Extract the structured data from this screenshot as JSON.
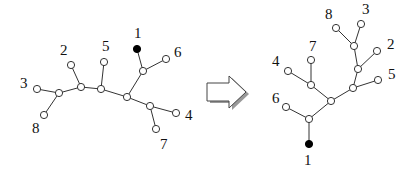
{
  "diagram": {
    "colors": {
      "edge": "#333333",
      "open_node": "#ffffff",
      "root_node": "#000000"
    },
    "left_tree": {
      "nodes": [
        {
          "id": "l1",
          "x": 137,
          "y": 49,
          "filled": true
        },
        {
          "id": "l2",
          "x": 71,
          "y": 65
        },
        {
          "id": "l3",
          "x": 37,
          "y": 89
        },
        {
          "id": "l4",
          "x": 176,
          "y": 113
        },
        {
          "id": "l5",
          "x": 104,
          "y": 62
        },
        {
          "id": "l6",
          "x": 166,
          "y": 59
        },
        {
          "id": "l7",
          "x": 156,
          "y": 129
        },
        {
          "id": "l8",
          "x": 44,
          "y": 115
        },
        {
          "id": "jA",
          "x": 59,
          "y": 93
        },
        {
          "id": "jB",
          "x": 81,
          "y": 87
        },
        {
          "id": "jC",
          "x": 101,
          "y": 89
        },
        {
          "id": "jD",
          "x": 127,
          "y": 97
        },
        {
          "id": "jE",
          "x": 143,
          "y": 71
        },
        {
          "id": "jF",
          "x": 150,
          "y": 106
        }
      ],
      "edges": [
        [
          "l3",
          "jA"
        ],
        [
          "l8",
          "jA"
        ],
        [
          "jA",
          "jB"
        ],
        [
          "l2",
          "jB"
        ],
        [
          "jB",
          "jC"
        ],
        [
          "l5",
          "jC"
        ],
        [
          "jC",
          "jD"
        ],
        [
          "jD",
          "jE"
        ],
        [
          "l1",
          "jE"
        ],
        [
          "l6",
          "jE"
        ],
        [
          "jD",
          "jF"
        ],
        [
          "l4",
          "jF"
        ],
        [
          "l7",
          "jF"
        ]
      ],
      "labels": [
        {
          "text": "1",
          "x": 134,
          "y": 38
        },
        {
          "text": "2",
          "x": 60,
          "y": 55
        },
        {
          "text": "3",
          "x": 20,
          "y": 88
        },
        {
          "text": "4",
          "x": 185,
          "y": 120
        },
        {
          "text": "5",
          "x": 102,
          "y": 51
        },
        {
          "text": "6",
          "x": 174,
          "y": 57
        },
        {
          "text": "7",
          "x": 160,
          "y": 149
        },
        {
          "text": "8",
          "x": 32,
          "y": 133
        }
      ]
    },
    "arrow": {
      "direction": "right",
      "label": "transform-arrow"
    },
    "right_tree": {
      "nodes": [
        {
          "id": "r1",
          "x": 309,
          "y": 144,
          "filled": true
        },
        {
          "id": "r2",
          "x": 377,
          "y": 51
        },
        {
          "id": "r3",
          "x": 361,
          "y": 24
        },
        {
          "id": "r4",
          "x": 288,
          "y": 71
        },
        {
          "id": "r5",
          "x": 378,
          "y": 80
        },
        {
          "id": "r6",
          "x": 286,
          "y": 107
        },
        {
          "id": "r7",
          "x": 311,
          "y": 60
        },
        {
          "id": "r8",
          "x": 336,
          "y": 28
        },
        {
          "id": "jP",
          "x": 354,
          "y": 46
        },
        {
          "id": "jQ",
          "x": 358,
          "y": 69
        },
        {
          "id": "jR",
          "x": 353,
          "y": 88
        },
        {
          "id": "jS",
          "x": 331,
          "y": 101
        },
        {
          "id": "jT",
          "x": 311,
          "y": 85
        },
        {
          "id": "jU",
          "x": 309,
          "y": 119
        }
      ],
      "edges": [
        [
          "r1",
          "jU"
        ],
        [
          "r6",
          "jU"
        ],
        [
          "jU",
          "jS"
        ],
        [
          "jS",
          "jT"
        ],
        [
          "r4",
          "jT"
        ],
        [
          "r7",
          "jT"
        ],
        [
          "jS",
          "jR"
        ],
        [
          "r5",
          "jR"
        ],
        [
          "jR",
          "jQ"
        ],
        [
          "r2",
          "jQ"
        ],
        [
          "jQ",
          "jP"
        ],
        [
          "r8",
          "jP"
        ],
        [
          "r3",
          "jP"
        ]
      ],
      "labels": [
        {
          "text": "1",
          "x": 304,
          "y": 165
        },
        {
          "text": "2",
          "x": 387,
          "y": 49
        },
        {
          "text": "3",
          "x": 362,
          "y": 14
        },
        {
          "text": "4",
          "x": 272,
          "y": 66
        },
        {
          "text": "5",
          "x": 388,
          "y": 79
        },
        {
          "text": "6",
          "x": 272,
          "y": 103
        },
        {
          "text": "7",
          "x": 309,
          "y": 51
        },
        {
          "text": "8",
          "x": 325,
          "y": 19
        }
      ]
    }
  }
}
